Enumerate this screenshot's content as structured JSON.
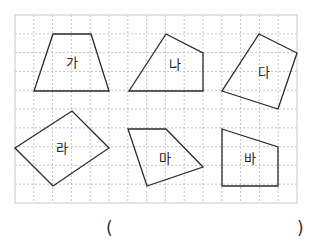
{
  "grid": {
    "x0": 15,
    "y0": 15,
    "cols": 15,
    "rows": 10,
    "cell": 18.8,
    "border_color": "#c8c8c8",
    "line_color": "#c4c4c4"
  },
  "shapes": [
    {
      "label": "가",
      "points": [
        [
          53,
          34
        ],
        [
          91,
          34
        ],
        [
          109,
          91
        ],
        [
          34,
          91
        ]
      ],
      "label_pos": [
        72,
        67
      ]
    },
    {
      "label": "나",
      "points": [
        [
          166,
          34
        ],
        [
          203,
          53
        ],
        [
          203,
          91
        ],
        [
          129,
          91
        ]
      ],
      "label_pos": [
        175,
        69
      ]
    },
    {
      "label": "다",
      "points": [
        [
          259,
          34
        ],
        [
          297,
          53
        ],
        [
          278,
          109
        ],
        [
          222,
          91
        ]
      ],
      "label_pos": [
        264,
        77
      ]
    },
    {
      "label": "라",
      "points": [
        [
          15,
          148
        ],
        [
          72,
          111
        ],
        [
          109,
          148
        ],
        [
          53,
          186
        ]
      ],
      "label_pos": [
        62,
        153
      ]
    },
    {
      "label": "마",
      "points": [
        [
          128,
          129
        ],
        [
          166,
          129
        ],
        [
          203,
          167
        ],
        [
          147,
          186
        ]
      ],
      "label_pos": [
        165,
        163
      ]
    },
    {
      "label": "바",
      "points": [
        [
          222,
          129
        ],
        [
          278,
          147
        ],
        [
          278,
          186
        ],
        [
          222,
          186
        ]
      ],
      "label_pos": [
        250,
        163
      ]
    }
  ],
  "answer": {
    "open_paren": "(",
    "close_paren": ")"
  }
}
